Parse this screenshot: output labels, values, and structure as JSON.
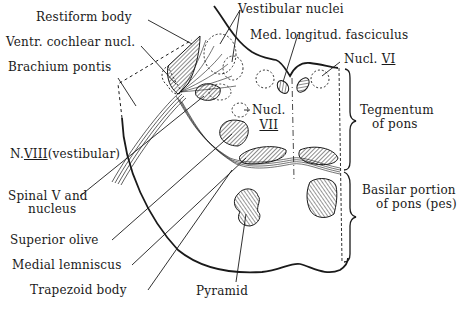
{
  "diagram": {
    "labels": {
      "restiform_body": "Restiform body",
      "ventr_cochlear_nucl": "Ventr. cochlear nucl.",
      "brachium_pontis": "Brachium pontis",
      "vestibular_nuclei": "Vestibular nuclei",
      "med_longitud_fasciculus": "Med. longitud. fasciculus",
      "nucl_vi_prefix": "Nucl.",
      "nucl_vi_numeral": "VI",
      "nucl_vii_prefix": "Nucl.",
      "nucl_vii_numeral": "VII",
      "n_viii_prefix": "N.",
      "n_viii_numeral": "VIII",
      "n_viii_suffix": "(vestibular)",
      "spinal_v_line1": "Spinal V and",
      "spinal_v_line2": "nucleus",
      "superior_olive": "Superior olive",
      "medial_lemniscus": "Medial lemniscus",
      "trapezoid_body": "Trapezoid body",
      "pyramid": "Pyramid",
      "tegmentum_line1": "Tegmentum",
      "tegmentum_line2": "of pons",
      "basilar_line1": "Basilar portion",
      "basilar_line2": "of pons (pes)"
    },
    "colors": {
      "ink": "#1a1a1a",
      "background": "#ffffff"
    }
  }
}
